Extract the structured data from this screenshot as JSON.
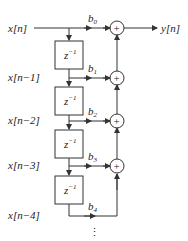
{
  "diagram": {
    "type": "FIR filter direct form (tapped delay line)",
    "input_label": "x[n]",
    "output_label": "y[n]",
    "delay_label": "z",
    "delay_exponent": "−1",
    "tap_labels": [
      "x[n−1]",
      "x[n−2]",
      "x[n−3]",
      "x[n−4]"
    ],
    "coefficients": [
      {
        "base": "b",
        "sub": "0"
      },
      {
        "base": "b",
        "sub": "1"
      },
      {
        "base": "b",
        "sub": "2"
      },
      {
        "base": "b",
        "sub": "3"
      },
      {
        "base": "b",
        "sub": "4"
      }
    ],
    "adder_symbol": "+",
    "continuation": "⋮"
  }
}
